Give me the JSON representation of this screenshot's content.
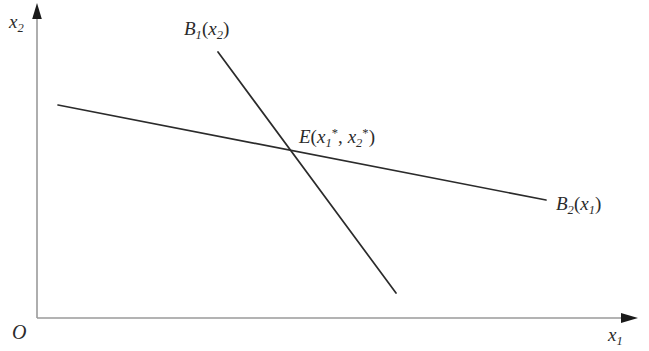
{
  "figure": {
    "type": "economic-equilibrium-diagram",
    "background_color": "#ffffff",
    "axis_color": "#9a9a9a",
    "curve_color": "#2b2b2b",
    "text_color": "#2b2b2b",
    "axes": {
      "origin_label": "O",
      "y_axis": {
        "name": "vertical-axis",
        "label_base": "x",
        "label_sub": "2",
        "label_full": "x2",
        "x_px": 37,
        "top_px": 5,
        "bottom_px": 318
      },
      "x_axis": {
        "name": "horizontal-axis",
        "label_base": "x",
        "label_sub": "1",
        "label_full": "x1",
        "y_px": 318,
        "left_px": 37,
        "right_px": 637
      }
    },
    "curves": [
      {
        "id": "b1",
        "label_base": "B",
        "label_sub": "1",
        "label_arg_base": "x",
        "label_arg_sub": "2",
        "label_full": "B1(x2)",
        "open_paren": "(",
        "close_paren": ")",
        "x1": 218,
        "y1": 52,
        "x2": 396,
        "y2": 293
      },
      {
        "id": "b2",
        "label_base": "B",
        "label_sub": "2",
        "label_arg_base": "x",
        "label_arg_sub": "1",
        "label_full": "B2(x1)",
        "open_paren": "(",
        "close_paren": ")",
        "x1": 58,
        "y1": 105,
        "x2": 546,
        "y2": 200
      }
    ],
    "equilibrium": {
      "name": "equilibrium-point",
      "label_base": "E",
      "open_paren": "(",
      "arg1_base": "x",
      "arg1_sub": "1",
      "arg1_sup": "*",
      "comma": ",",
      "arg2_base": "x",
      "arg2_sub": "2",
      "arg2_sup": "*",
      "close_paren": ")",
      "label_full": "E(x1*, x2*)",
      "x_px": 290,
      "y_px": 151
    }
  }
}
